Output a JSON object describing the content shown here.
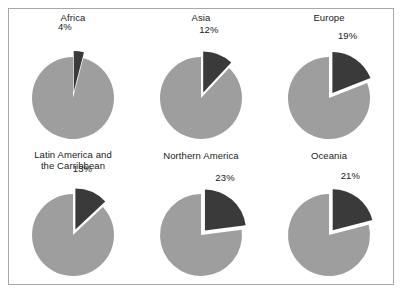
{
  "figure": {
    "background_color": "#ffffff",
    "border_color": "#a8a8a8",
    "major_slice_color": "#9e9e9e",
    "exploded_slice_color": "#3a3a3a",
    "gap_color": "#ffffff",
    "text_color": "#1a1a1a"
  },
  "chart_data": [
    {
      "type": "pie",
      "title": "Africa",
      "categories": [
        "Remainder",
        "Share"
      ],
      "values": [
        96,
        4
      ],
      "labels": [
        "",
        "4%"
      ],
      "annotations": [
        "4%"
      ],
      "colors": [
        "#9e9e9e",
        "#3a3a3a"
      ],
      "exploded_index": 1,
      "start_angle_deg": 0,
      "legend": "none"
    },
    {
      "type": "pie",
      "title": "Asia",
      "categories": [
        "Remainder",
        "Share"
      ],
      "values": [
        88,
        12
      ],
      "labels": [
        "",
        "12%"
      ],
      "annotations": [
        "12%"
      ],
      "colors": [
        "#9e9e9e",
        "#3a3a3a"
      ],
      "exploded_index": 1,
      "start_angle_deg": 0,
      "legend": "none"
    },
    {
      "type": "pie",
      "title": "Europe",
      "categories": [
        "Remainder",
        "Share"
      ],
      "values": [
        81,
        19
      ],
      "labels": [
        "",
        "19%"
      ],
      "annotations": [
        "19%"
      ],
      "colors": [
        "#9e9e9e",
        "#3a3a3a"
      ],
      "exploded_index": 1,
      "start_angle_deg": 0,
      "legend": "none"
    },
    {
      "type": "pie",
      "title": "Latin America and\nthe Carribbean",
      "categories": [
        "Remainder",
        "Share"
      ],
      "values": [
        87,
        13
      ],
      "labels": [
        "",
        "13%"
      ],
      "annotations": [
        "13%"
      ],
      "colors": [
        "#9e9e9e",
        "#3a3a3a"
      ],
      "exploded_index": 1,
      "start_angle_deg": 0,
      "legend": "none"
    },
    {
      "type": "pie",
      "title": "Northern America",
      "categories": [
        "Remainder",
        "Share"
      ],
      "values": [
        77,
        23
      ],
      "labels": [
        "",
        "23%"
      ],
      "annotations": [
        "23%"
      ],
      "colors": [
        "#9e9e9e",
        "#3a3a3a"
      ],
      "exploded_index": 1,
      "start_angle_deg": 0,
      "legend": "none"
    },
    {
      "type": "pie",
      "title": "Oceania",
      "categories": [
        "Remainder",
        "Share"
      ],
      "values": [
        79,
        21
      ],
      "labels": [
        "",
        "21%"
      ],
      "annotations": [
        "21%"
      ],
      "colors": [
        "#9e9e9e",
        "#3a3a3a"
      ],
      "exploded_index": 1,
      "start_angle_deg": 0,
      "legend": "none"
    }
  ]
}
